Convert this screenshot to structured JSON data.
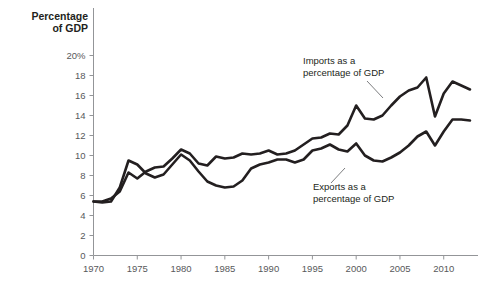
{
  "chart_data": {
    "type": "line",
    "title": "Percentage of GDP",
    "xlabel": "",
    "ylabel": "Percentage of GDP",
    "xlim": [
      1970,
      2013
    ],
    "ylim": [
      0,
      20
    ],
    "grid": false,
    "legend_position": "inline-annotations",
    "y_ticks": [
      0,
      2,
      4,
      6,
      8,
      10,
      12,
      14,
      16,
      18,
      20
    ],
    "y_tick_labels": [
      "0",
      "2",
      "4",
      "6",
      "8",
      "10",
      "12",
      "14",
      "16",
      "18",
      "20%"
    ],
    "x_ticks": [
      1970,
      1975,
      1980,
      1985,
      1990,
      1995,
      2000,
      2005,
      2010
    ],
    "x_tick_labels": [
      "1970",
      "1975",
      "1980",
      "1985",
      "1990",
      "1995",
      "2000",
      "2005",
      "2010"
    ],
    "x": [
      1970,
      1971,
      1972,
      1973,
      1974,
      1975,
      1976,
      1977,
      1978,
      1979,
      1980,
      1981,
      1982,
      1983,
      1984,
      1985,
      1986,
      1987,
      1988,
      1989,
      1990,
      1991,
      1992,
      1993,
      1994,
      1995,
      1996,
      1997,
      1998,
      1999,
      2000,
      2001,
      2002,
      2003,
      2004,
      2005,
      2006,
      2007,
      2008,
      2009,
      2010,
      2011,
      2012,
      2013
    ],
    "series": [
      {
        "name": "Imports as a percentage of GDP",
        "values": [
          5.4,
          5.4,
          5.7,
          6.4,
          8.3,
          7.7,
          8.4,
          8.8,
          8.9,
          9.7,
          10.6,
          10.2,
          9.2,
          9.0,
          9.9,
          9.7,
          9.8,
          10.2,
          10.1,
          10.2,
          10.5,
          10.1,
          10.2,
          10.5,
          11.1,
          11.7,
          11.8,
          12.2,
          12.1,
          13.0,
          15.0,
          13.7,
          13.6,
          14.0,
          15.0,
          15.9,
          16.5,
          16.8,
          17.8,
          13.9,
          16.2,
          17.4,
          17.0,
          16.6
        ]
      },
      {
        "name": "Exports as a percentage of GDP",
        "values": [
          5.4,
          5.3,
          5.4,
          6.8,
          9.5,
          9.1,
          8.2,
          7.8,
          8.1,
          9.1,
          10.1,
          9.5,
          8.4,
          7.4,
          7.0,
          6.8,
          6.9,
          7.5,
          8.7,
          9.1,
          9.3,
          9.6,
          9.6,
          9.3,
          9.6,
          10.5,
          10.7,
          11.1,
          10.6,
          10.4,
          11.2,
          10.0,
          9.5,
          9.4,
          9.8,
          10.3,
          11.0,
          11.9,
          12.4,
          11.0,
          12.4,
          13.6,
          13.6,
          13.5
        ]
      }
    ],
    "annotations": [
      {
        "name": "imports-annotation",
        "line1": "Imports as a",
        "line2": "percentage of GDP",
        "leader_from": [
          0.0,
          0.0
        ],
        "leader_to": [
          0.0,
          0.0
        ]
      },
      {
        "name": "exports-annotation",
        "line1": "Exports as a",
        "line2": "percentage of GDP",
        "leader_from": [
          0.0,
          0.0
        ],
        "leader_to": [
          0.0,
          0.0
        ]
      }
    ]
  },
  "axis_title": {
    "line1": "Percentage",
    "line2": "of GDP"
  },
  "colors": {
    "line": "#231f20",
    "axis": "#939598",
    "tick_text": "#58595b",
    "background": "#ffffff"
  }
}
